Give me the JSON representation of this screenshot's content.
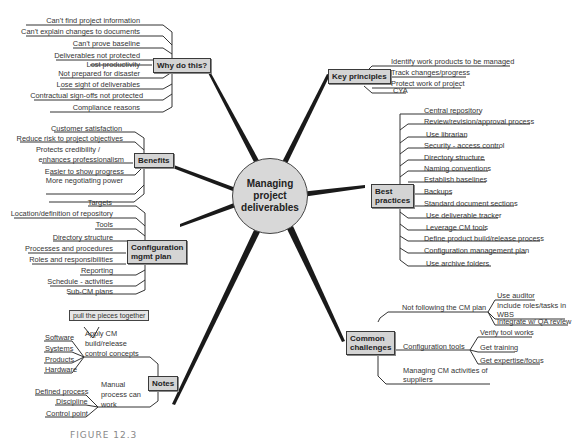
{
  "center": {
    "label": "Managing project deliverables"
  },
  "branches": {
    "why": {
      "label": "Why do this?",
      "items": [
        "Can't find project information",
        "Can't explain changes to documents",
        "Can't prove baseline",
        "Deliverables not protected",
        "Lost productivity",
        "Not prepared for disaster",
        "Lose sight of deliverables",
        "Contractual sign-offs not protected",
        "Compliance reasons"
      ]
    },
    "benefits": {
      "label": "Benefits",
      "items": [
        "Customer satisfaction",
        "Reduce risk to project objectives",
        "Protects credibility /",
        "enhances professionalism",
        "Easier to show progress",
        "More negotiating power"
      ]
    },
    "cm_plan": {
      "label_1": "Configuration",
      "label_2": "mgmt plan",
      "items": [
        "Targets",
        "Location/definition of repository",
        "Tools",
        "Directory structure",
        "Processes and procedures",
        "Roles and responsibilities",
        "Reporting",
        "Schedule - activities",
        "Sub-CM plans"
      ]
    },
    "notes": {
      "label": "Notes",
      "callout": "pull the pieces together",
      "apply": {
        "line1": "Apply CM",
        "line2": "build/release",
        "line3": "control concepts",
        "items": [
          "Software",
          "Systems",
          "Products",
          "Hardware"
        ]
      },
      "manual": {
        "line1": "Manual",
        "line2": "process can",
        "line3": "work",
        "items": [
          "Defined process",
          "Discipline",
          "Control point"
        ]
      }
    },
    "key": {
      "label": "Key principles",
      "items": [
        "Identify work products to be managed",
        "Track changes/progress",
        "Protect work of project",
        "CYA"
      ]
    },
    "best": {
      "label_1": "Best",
      "label_2": "practices",
      "items": [
        "Central repository",
        "Review/revision/approval process",
        "Use librarian",
        "Security - access control",
        "Directory structure",
        "Naming conventions",
        "Establish baselines",
        "Backups",
        "Standard document sections",
        "Use deliverable tracker",
        "Leverage CM tools",
        "Define product build/release process",
        "Configuration management plan",
        "Use archive folders"
      ]
    },
    "challenges": {
      "label_1": "Common",
      "label_2": "challenges",
      "not_following": {
        "label": "Not following the CM plan",
        "items": [
          "Use auditor",
          "Include roles/tasks in",
          "WBS",
          "Integrate w/ QA review"
        ]
      },
      "tools": {
        "label": "Configuration tools",
        "items": [
          "Verify tool works",
          "Get training",
          "Get expertise/focus"
        ]
      },
      "suppliers": {
        "line1": "Managing CM activities of",
        "line2": "suppliers"
      }
    }
  },
  "caption": "FIGURE 12.3"
}
